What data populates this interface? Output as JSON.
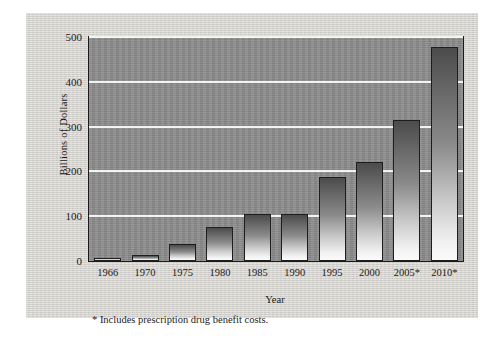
{
  "figure": {
    "y_axis_title": "Billions of Dollars",
    "x_axis_title": "Year",
    "footnote": "* Includes prescription drug benefit costs."
  },
  "chart_data": {
    "type": "bar",
    "title": "",
    "xlabel": "Year",
    "ylabel": "Billions of Dollars",
    "categories": [
      "1966",
      "1970",
      "1975",
      "1980",
      "1985",
      "1990",
      "1995",
      "2000",
      "2005*",
      "2010*"
    ],
    "values": [
      2,
      13,
      37,
      75,
      105,
      105,
      188,
      222,
      315,
      478
    ],
    "ylim": [
      0,
      500
    ],
    "yticks": [
      0,
      100,
      200,
      300,
      400,
      500
    ],
    "ytick_labels": [
      "0",
      "100",
      "200",
      "300",
      "400",
      "500"
    ],
    "grid": true,
    "grid_color": "#f4f3f0",
    "legend": null,
    "annotations": [
      "* Includes prescription drug benefit costs."
    ],
    "bar_top_color": "#4b4b4b",
    "bar_bottom_color": "#fbfbfb",
    "plot_background": "#8b8b8b",
    "panel_background": "#d6d4cf"
  }
}
